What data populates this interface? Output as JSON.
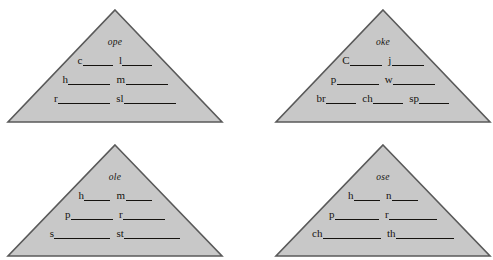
{
  "page": {
    "background_color": "#ffffff",
    "text_color": "#15130f"
  },
  "style": {
    "triangle_fill": "#c8c8c8",
    "triangle_stroke": "#5a5a5a"
  },
  "pyramids": [
    {
      "id": "pyramid-1",
      "position": "top-left",
      "rime": "ope",
      "rows": [
        {
          "prompts": [
            {
              "onset": "c",
              "blank_width": 30
            },
            {
              "onset": "l",
              "blank_width": 30
            }
          ]
        },
        {
          "prompts": [
            {
              "onset": "h",
              "blank_width": 42
            },
            {
              "onset": "m",
              "blank_width": 42
            }
          ]
        },
        {
          "prompts": [
            {
              "onset": "r",
              "blank_width": 52
            },
            {
              "onset": "sl",
              "blank_width": 52
            }
          ]
        }
      ]
    },
    {
      "id": "pyramid-2",
      "position": "top-right",
      "rime": "oke",
      "rows": [
        {
          "prompts": [
            {
              "onset": "C",
              "blank_width": 32
            },
            {
              "onset": "j",
              "blank_width": 32
            }
          ]
        },
        {
          "prompts": [
            {
              "onset": "p",
              "blank_width": 42
            },
            {
              "onset": "w",
              "blank_width": 42
            }
          ]
        },
        {
          "prompts": [
            {
              "onset": "br",
              "blank_width": 30
            },
            {
              "onset": "ch",
              "blank_width": 30
            },
            {
              "onset": "sp",
              "blank_width": 30
            }
          ]
        }
      ]
    },
    {
      "id": "pyramid-3",
      "position": "bottom-left",
      "rime": "ole",
      "rows": [
        {
          "prompts": [
            {
              "onset": "h",
              "blank_width": 26
            },
            {
              "onset": "m",
              "blank_width": 26
            }
          ]
        },
        {
          "prompts": [
            {
              "onset": "p",
              "blank_width": 42
            },
            {
              "onset": "r",
              "blank_width": 42
            }
          ]
        },
        {
          "prompts": [
            {
              "onset": "s",
              "blank_width": 56
            },
            {
              "onset": "st",
              "blank_width": 56
            }
          ]
        }
      ]
    },
    {
      "id": "pyramid-4",
      "position": "bottom-right",
      "rime": "ose",
      "rows": [
        {
          "prompts": [
            {
              "onset": "h",
              "blank_width": 26
            },
            {
              "onset": "n",
              "blank_width": 26
            }
          ]
        },
        {
          "prompts": [
            {
              "onset": "p",
              "blank_width": 44
            },
            {
              "onset": "r",
              "blank_width": 48
            }
          ]
        },
        {
          "prompts": [
            {
              "onset": "ch",
              "blank_width": 58
            },
            {
              "onset": "th",
              "blank_width": 58
            }
          ]
        }
      ]
    }
  ]
}
